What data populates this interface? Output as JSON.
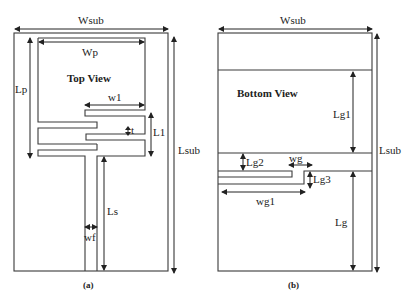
{
  "panel_a": {
    "caption": "(a)",
    "view_title": "Top View",
    "labels": {
      "wsub": "Wsub",
      "wp": "Wp",
      "lp": "Lp",
      "w1": "w1",
      "l1": "L1",
      "t": "t",
      "lsub": "Lsub",
      "ls": "Ls",
      "wf": "wf"
    }
  },
  "panel_b": {
    "caption": "(b)",
    "view_title": "Bottom View",
    "labels": {
      "wsub": "Wsub",
      "lg1": "Lg1",
      "lsub": "Lsub",
      "lg2": "Lg2",
      "wg": "wg",
      "lg3": "Lg3",
      "wg1": "wg1",
      "lg": "Lg"
    }
  },
  "colors": {
    "line": "#3a3a3a",
    "text": "#222222",
    "background": "#ffffff"
  }
}
